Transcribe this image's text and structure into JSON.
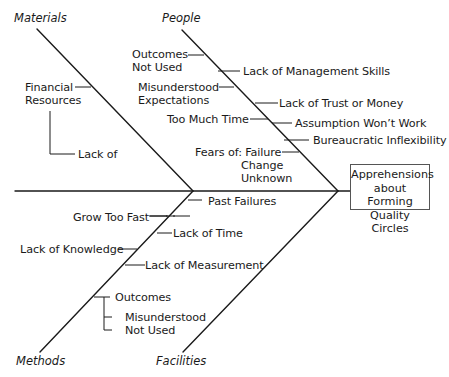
{
  "effect": {
    "line1": "Apprehensions",
    "line2": "about Forming",
    "line3": "Quality Circles"
  },
  "categories": {
    "materials": "Materials",
    "people": "People",
    "methods": "Methods",
    "facilities": "Facilities"
  },
  "materials": {
    "financial_1": "Financial",
    "financial_2": "Resources",
    "lack_of": "Lack of"
  },
  "people": {
    "outcomes_1": "Outcomes",
    "outcomes_2": "Not Used",
    "mgmt": "Lack of Management Skills",
    "misund_1": "Misunderstood",
    "misund_2": "Expectations",
    "trust": "Lack of Trust or Money",
    "too_much": "Too Much Time",
    "assumption": "Assumption Won’t Work",
    "bureau": "Bureaucratic Inflexibility",
    "fears": "Fears of: Failure",
    "fears_change": "Change",
    "fears_unknown": "Unknown"
  },
  "methods": {
    "grow": "Grow Too Fast",
    "knowledge": "Lack of Knowledge",
    "outcomes": "Outcomes",
    "misunderstood": "Misunderstood",
    "not_used": "Not Used"
  },
  "facilities": {
    "past": "Past Failures",
    "time": "Lack of Time",
    "measurement": "Lack of Measurement"
  }
}
